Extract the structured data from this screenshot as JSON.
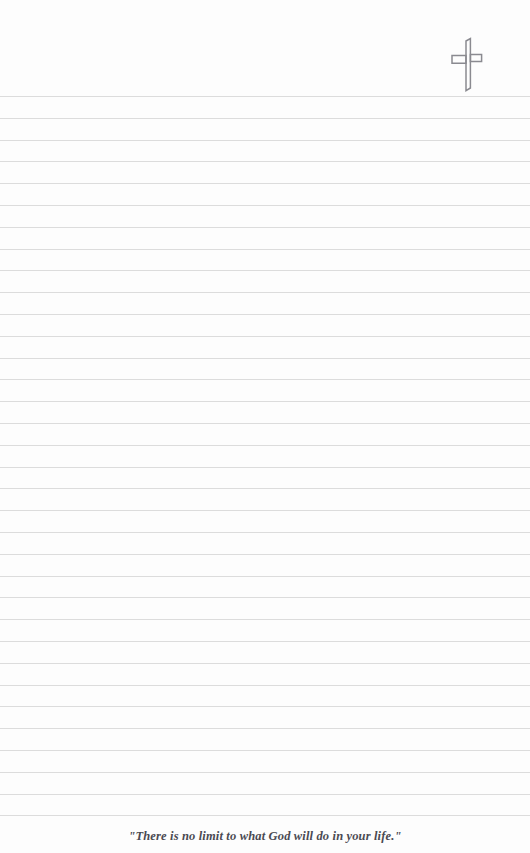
{
  "page": {
    "background_color": "#fdfdfd",
    "width": 530,
    "height": 853
  },
  "header": {
    "emblem": {
      "icon_name": "cross-icon",
      "color": "#8a8a90",
      "style": "outline",
      "position": "top-right"
    }
  },
  "writing_area": {
    "line_color": "#dcdcdc",
    "line_count": 34,
    "first_line_y": 96,
    "line_spacing": 21.8,
    "full_width_rules": true
  },
  "footer": {
    "quote": "\"There is no limit to what God will do in your life.\"",
    "quote_color": "#4a4a52",
    "alignment": "center"
  }
}
